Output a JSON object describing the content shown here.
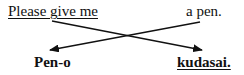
{
  "diagram": {
    "top_row": {
      "left": {
        "text": "Please give me",
        "underlined": true
      },
      "right": {
        "text": "a pen.",
        "underlined": false
      }
    },
    "bottom_row": {
      "left": {
        "text": "Pen-o",
        "underlined": false
      },
      "right": {
        "text": "kudasai.",
        "underlined": true
      }
    },
    "arrows": [
      {
        "from": "Please give me",
        "to": "kudasai."
      },
      {
        "from": "a pen.",
        "to": "Pen-o"
      }
    ]
  }
}
